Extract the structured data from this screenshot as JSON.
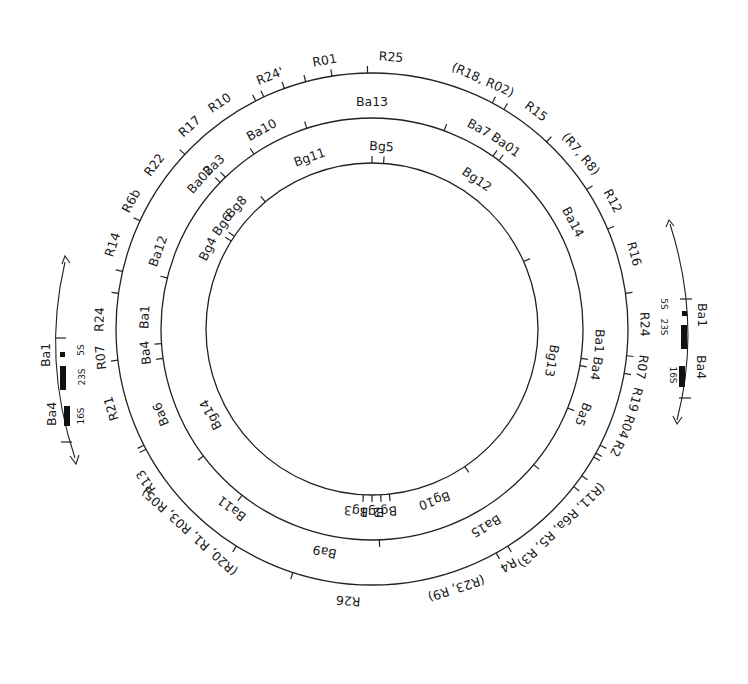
{
  "diagram": {
    "type": "circular restriction map",
    "center": [
      372,
      329
    ],
    "rings": [
      {
        "name": "EcoRI",
        "radius": 256,
        "ticks": [
          -20,
          -15,
          -9,
          -1,
          28,
          31,
          43,
          57,
          67,
          82,
          96,
          100,
          117,
          119,
          120,
          125,
          128,
          148,
          151,
          198,
          212,
          242,
          243,
          263,
          278,
          283,
          295,
          313,
          333,
          335
        ],
        "labels": [
          {
            "text": "R25",
            "angle": 4
          },
          {
            "text": "(R18, R02)",
            "angle": 24
          },
          {
            "text": "R15",
            "angle": 37
          },
          {
            "text": "(R7, R8)",
            "angle": 50
          },
          {
            "text": "R12",
            "angle": 62
          },
          {
            "text": "R16",
            "angle": 74
          },
          {
            "text": "R24",
            "angle": 89
          },
          {
            "text": "R07",
            "angle": 98
          },
          {
            "text": "R19",
            "angle": 105
          },
          {
            "text": "R04",
            "angle": 111
          },
          {
            "text": "R2",
            "angle": 116
          },
          {
            "text": "(R11, R6a, R5, R3)",
            "angle": 136
          },
          {
            "text": "R4",
            "angle": 150
          },
          {
            "text": "(R23, R9)",
            "angle": 162
          },
          {
            "text": "R26",
            "angle": 185
          },
          {
            "text": "(R20, R1, R03, R05)",
            "angle": 222
          },
          {
            "text": "R13",
            "angle": 236
          },
          {
            "text": "R21",
            "angle": 253
          },
          {
            "text": "R07",
            "angle": 264
          },
          {
            "text": "R24",
            "angle": 272
          },
          {
            "text": "R14",
            "angle": 288
          },
          {
            "text": "R6b",
            "angle": 298
          },
          {
            "text": "R22",
            "angle": 307
          },
          {
            "text": "R17",
            "angle": 318
          },
          {
            "text": "R10",
            "angle": 326
          },
          {
            "text": "R24'",
            "angle": 338
          },
          {
            "text": "R01",
            "angle": 350
          }
        ]
      },
      {
        "name": "BamHI",
        "radius": 211,
        "ticks": [
          -18,
          20,
          35,
          37,
          98,
          100,
          112,
          130,
          178,
          218,
          233,
          262,
          266,
          284,
          314,
          316,
          326
        ],
        "labels": [
          {
            "text": "Ba13",
            "angle": 0
          },
          {
            "text": "Ba7",
            "angle": 28
          },
          {
            "text": "Ba01",
            "angle": 36
          },
          {
            "text": "Ba14",
            "angle": 62
          },
          {
            "text": "Ba1",
            "angle": 93
          },
          {
            "text": "Ba4",
            "angle": 100
          },
          {
            "text": "Ba5",
            "angle": 112
          },
          {
            "text": "Ba15",
            "angle": 150
          },
          {
            "text": "Ba9",
            "angle": 192
          },
          {
            "text": "Ba11",
            "angle": 218
          },
          {
            "text": "Ba6",
            "angle": 248
          },
          {
            "text": "Ba4",
            "angle": 264
          },
          {
            "text": "Ba1",
            "angle": 273
          },
          {
            "text": "Ba12",
            "angle": 290
          },
          {
            "text": "Ba3",
            "angle": 316
          },
          {
            "text": "Ba02",
            "angle": 311
          },
          {
            "text": "Ba10",
            "angle": 331
          }
        ]
      },
      {
        "name": "BglII",
        "radius": 166,
        "ticks": [
          0,
          4,
          66,
          146,
          174,
          177,
          180,
          183,
          302,
          304,
          320
        ],
        "labels": [
          {
            "text": "Bg5",
            "angle": 3
          },
          {
            "text": "Bg12",
            "angle": 35
          },
          {
            "text": "Bg13",
            "angle": 100
          },
          {
            "text": "Bg10",
            "angle": 160
          },
          {
            "text": "Bg2",
            "angle": 176
          },
          {
            "text": "Bg1",
            "angle": 180
          },
          {
            "text": "Bg3",
            "angle": 185
          },
          {
            "text": "Bg14",
            "angle": 242
          },
          {
            "text": "Bg4",
            "angle": 296
          },
          {
            "text": "Bg6",
            "angle": 305
          },
          {
            "text": "Bg8",
            "angle": 312
          },
          {
            "text": "Bg11",
            "angle": 340
          }
        ]
      }
    ],
    "rrna_insets": [
      {
        "side": "left",
        "labels": {
          "ba1": "Ba1",
          "ba4": "Ba4",
          "s5": "5S",
          "s23": "23S",
          "s16": "16S"
        }
      },
      {
        "side": "right",
        "labels": {
          "ba1": "Ba1",
          "ba4": "Ba4",
          "s5": "5S",
          "s23": "23S",
          "s16": "16S"
        }
      }
    ]
  }
}
